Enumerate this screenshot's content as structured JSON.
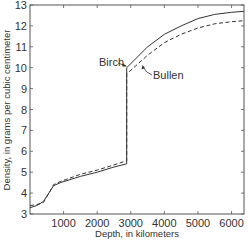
{
  "chart_data": {
    "type": "line",
    "title": "",
    "xlabel": "Depth, in kilometers",
    "ylabel": "Density, in grams per cubic centimeter",
    "xlim": [
      0,
      6371
    ],
    "ylim": [
      3,
      13
    ],
    "xticks": [
      1000,
      2000,
      3000,
      4000,
      5000,
      6000
    ],
    "xtick_labels": [
      "1000",
      "2000",
      "3000",
      "4000",
      "5000",
      "6000"
    ],
    "yticks": [
      3,
      4,
      5,
      6,
      7,
      8,
      9,
      10,
      11,
      12,
      13
    ],
    "ytick_labels": [
      "3",
      "4",
      "5",
      "6",
      "7",
      "8",
      "9",
      "10",
      "11",
      "12",
      "13"
    ],
    "grid": false,
    "legend": "none (inline annotations)",
    "series": [
      {
        "name": "Birch",
        "style": "solid",
        "x": [
          0,
          200,
          400,
          600,
          700,
          900,
          1500,
          2000,
          2500,
          2880,
          2880,
          3500,
          4000,
          4500,
          5000,
          5500,
          6000,
          6371
        ],
        "y": [
          3.3,
          3.4,
          3.6,
          4.1,
          4.35,
          4.5,
          4.8,
          5.0,
          5.25,
          5.4,
          10.0,
          11.0,
          11.6,
          12.0,
          12.35,
          12.55,
          12.65,
          12.7
        ]
      },
      {
        "name": "Bullen",
        "style": "dashed",
        "x": [
          0,
          200,
          400,
          600,
          700,
          900,
          1500,
          2000,
          2500,
          2880,
          2880,
          3500,
          4000,
          4500,
          5000,
          5500,
          6000,
          6371
        ],
        "y": [
          3.4,
          3.45,
          3.55,
          4.1,
          4.4,
          4.55,
          4.9,
          5.1,
          5.35,
          5.55,
          9.7,
          10.6,
          11.2,
          11.6,
          11.9,
          12.1,
          12.2,
          12.25
        ]
      }
    ],
    "annotations": [
      {
        "text": "Birch",
        "points_to": "Birch",
        "at_x": 2880,
        "at_y": 10.1
      },
      {
        "text": "Bullen",
        "points_to": "Bullen",
        "at_x": 3100,
        "at_y": 9.9
      }
    ]
  },
  "labels": {
    "xlabel": "Depth, in kilometers",
    "ylabel": "Density, in grams per cubic centimeter",
    "birch": "Birch",
    "bullen": "Bullen"
  }
}
